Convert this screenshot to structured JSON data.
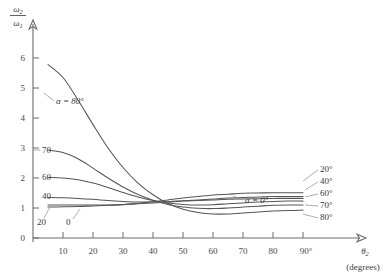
{
  "chart_data": {
    "type": "line",
    "title": "",
    "subtitle": "",
    "xlabel": "θ",
    "xlabel_sub": "2",
    "xlabel_units": "(degrees)",
    "ylabel_num": "ω",
    "ylabel_num_sub": "2",
    "ylabel_den": "ω",
    "ylabel_den_sub": "1",
    "xlim": [
      0,
      100
    ],
    "ylim": [
      0,
      6.6
    ],
    "grid": false,
    "legend_position": "inline-curve-labels",
    "xticks": [
      10,
      20,
      30,
      40,
      50,
      60,
      70,
      80,
      90
    ],
    "xtick_labels": [
      "10",
      "20",
      "30",
      "40",
      "50",
      "60",
      "70",
      "80",
      "90°"
    ],
    "yticks": [
      0,
      1,
      2,
      3,
      4,
      5,
      6
    ],
    "ytick_labels": [
      "0",
      "1",
      "2",
      "3",
      "4",
      "5",
      "6"
    ],
    "series": [
      {
        "name": "α = 0°",
        "alpha_deg": 0,
        "left_label": "0",
        "right_label": "α = 0°",
        "x": [
          5,
          10,
          15,
          20,
          25,
          30,
          35,
          40,
          45,
          50,
          55,
          60,
          65,
          70,
          75,
          80,
          85,
          90
        ],
        "values": [
          1.03,
          1.04,
          1.05,
          1.07,
          1.09,
          1.11,
          1.14,
          1.17,
          1.2,
          1.23,
          1.25,
          1.27,
          1.29,
          1.3,
          1.31,
          1.32,
          1.32,
          1.32
        ]
      },
      {
        "name": "20°",
        "alpha_deg": 20,
        "left_label": "20",
        "right_label": "20°",
        "x": [
          5,
          10,
          15,
          20,
          25,
          30,
          35,
          40,
          45,
          50,
          55,
          60,
          65,
          70,
          75,
          80,
          85,
          90
        ],
        "values": [
          1.1,
          1.1,
          1.1,
          1.1,
          1.1,
          1.12,
          1.16,
          1.21,
          1.27,
          1.33,
          1.38,
          1.43,
          1.46,
          1.49,
          1.5,
          1.51,
          1.51,
          1.51
        ]
      },
      {
        "name": "40°",
        "alpha_deg": 40,
        "left_label": "40",
        "right_label": "40°",
        "x": [
          5,
          10,
          15,
          20,
          25,
          30,
          35,
          40,
          45,
          50,
          55,
          60,
          65,
          70,
          75,
          80,
          85,
          90
        ],
        "values": [
          1.35,
          1.34,
          1.32,
          1.29,
          1.25,
          1.22,
          1.2,
          1.2,
          1.21,
          1.24,
          1.27,
          1.3,
          1.33,
          1.35,
          1.37,
          1.38,
          1.38,
          1.38
        ]
      },
      {
        "name": "60°",
        "alpha_deg": 60,
        "left_label": "60",
        "right_label": "60°",
        "x": [
          5,
          10,
          15,
          20,
          25,
          30,
          35,
          40,
          45,
          50,
          55,
          60,
          65,
          70,
          75,
          80,
          85,
          90
        ],
        "values": [
          2.02,
          2.0,
          1.94,
          1.83,
          1.68,
          1.52,
          1.37,
          1.25,
          1.17,
          1.12,
          1.1,
          1.11,
          1.14,
          1.17,
          1.2,
          1.22,
          1.23,
          1.23
        ]
      },
      {
        "name": "70°",
        "alpha_deg": 70,
        "left_label": "70",
        "right_label": "70°",
        "x": [
          5,
          10,
          15,
          20,
          25,
          30,
          35,
          40,
          45,
          50,
          55,
          60,
          65,
          70,
          75,
          80,
          85,
          90
        ],
        "values": [
          2.93,
          2.85,
          2.64,
          2.33,
          2.0,
          1.7,
          1.45,
          1.26,
          1.12,
          1.03,
          0.99,
          0.98,
          1.0,
          1.03,
          1.06,
          1.09,
          1.1,
          1.1
        ]
      },
      {
        "name": "α = 80°",
        "alpha_deg": 80,
        "left_label": "α = 80°",
        "right_label": "80°",
        "x": [
          5,
          10,
          15,
          20,
          25,
          30,
          35,
          40,
          45,
          50,
          55,
          60,
          65,
          70,
          75,
          80,
          85,
          90
        ],
        "values": [
          5.78,
          5.35,
          4.6,
          3.78,
          3.0,
          2.35,
          1.83,
          1.44,
          1.15,
          0.96,
          0.85,
          0.8,
          0.8,
          0.83,
          0.87,
          0.9,
          0.92,
          0.93
        ]
      }
    ],
    "inline_labels_left": [
      "α = 80°",
      "70",
      "60",
      "40",
      "20",
      "0"
    ],
    "inline_labels_right": [
      "α = 0°",
      "20°",
      "40°",
      "60°",
      "70°",
      "80°"
    ],
    "colors": {
      "curve": "#555555",
      "axis": "#6b6b6b",
      "text": "#3a3a3a",
      "background": "#ffffff"
    }
  }
}
